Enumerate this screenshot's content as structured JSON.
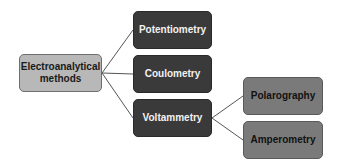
{
  "diagram": {
    "type": "tree",
    "colors": {
      "root_fill": "#b8b8b8",
      "level1_fill": "#3a3a3a",
      "level2_fill": "#7a7a7a",
      "line": "#555555"
    },
    "root": {
      "label_line1": "Electroanalytical",
      "label_line2": "methods"
    },
    "level1": [
      {
        "label": "Potentiometry"
      },
      {
        "label": "Coulometry"
      },
      {
        "label": "Voltammetry"
      }
    ],
    "level2": [
      {
        "label": "Polarography",
        "parent": "Voltammetry"
      },
      {
        "label": "Amperometry",
        "parent": "Voltammetry"
      }
    ],
    "edges": [
      [
        "Electroanalytical methods",
        "Potentiometry"
      ],
      [
        "Electroanalytical methods",
        "Coulometry"
      ],
      [
        "Electroanalytical methods",
        "Voltammetry"
      ],
      [
        "Voltammetry",
        "Polarography"
      ],
      [
        "Voltammetry",
        "Amperometry"
      ]
    ]
  }
}
